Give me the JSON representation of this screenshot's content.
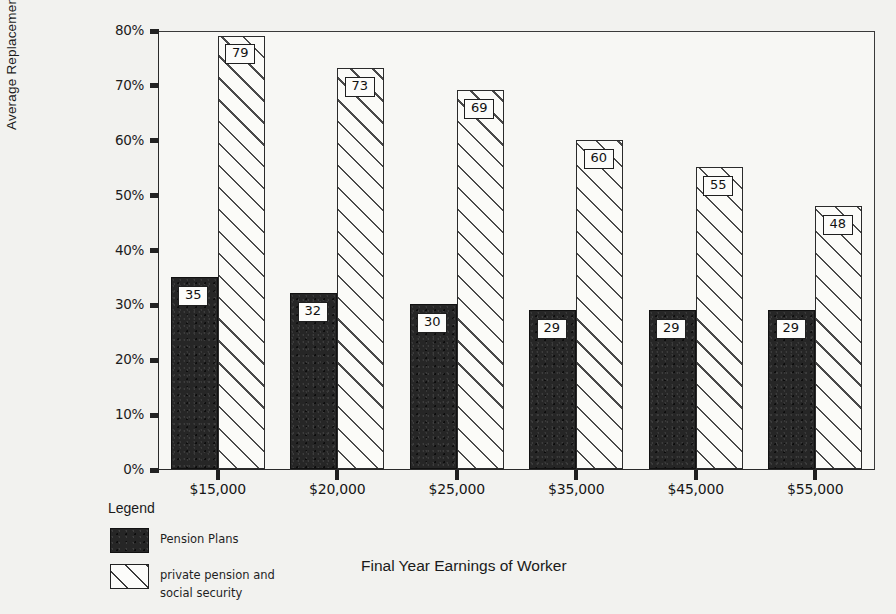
{
  "chart_data": {
    "type": "bar",
    "title": "",
    "xlabel": "Final Year Earnings of Worker",
    "ylabel": "Average Replacement Rate",
    "categories": [
      "$15,000",
      "$20,000",
      "$25,000",
      "$35,000",
      "$45,000",
      "$55,000"
    ],
    "series": [
      {
        "name": "Pension Plans",
        "values": [
          35,
          32,
          30,
          29,
          29,
          29
        ],
        "style": "solid-black"
      },
      {
        "name": "private pension and social security",
        "values": [
          79,
          73,
          69,
          60,
          55,
          48
        ],
        "style": "diagonal-hatch"
      }
    ],
    "ylim": [
      0,
      80
    ],
    "ytick_labels": [
      "0%",
      "10%",
      "20%",
      "30%",
      "40%",
      "50%",
      "60%",
      "70%",
      "80%"
    ],
    "ytick_values": [
      0,
      10,
      20,
      30,
      40,
      50,
      60,
      70,
      80
    ],
    "grid": false,
    "legend_position": "below-left",
    "value_labels": true,
    "colors": {
      "series1": "#262626",
      "series2_fill": "#fbfbf8",
      "series2_line": "#4a4a4a",
      "axis": "#222222",
      "background": "#f2f2ef",
      "plot_background": "#f7f7f4",
      "text": "#1a1a1a"
    }
  },
  "legend": {
    "title": "Legend",
    "entries": [
      {
        "label": "Pension Plans",
        "label_line2": ""
      },
      {
        "label": "private pension and",
        "label_line2": "social security"
      }
    ]
  },
  "axes": {
    "y_title": "Average Replacement Rate",
    "x_title": "Final Year Earnings of Worker"
  }
}
